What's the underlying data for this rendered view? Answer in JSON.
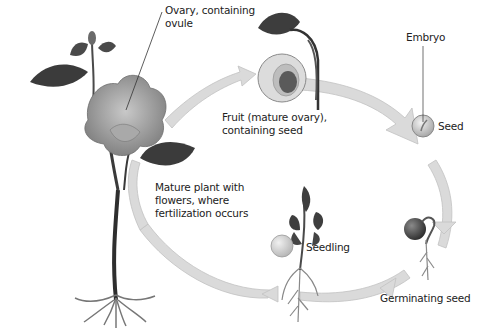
{
  "diagram": {
    "type": "plant-life-cycle",
    "colors": {
      "arrow": "#d9d9d9",
      "arrow_edge": "#bdbdbd",
      "leaf_dark": "#3a3a3a",
      "flower": "#9a9a9a",
      "text": "#222222"
    },
    "stages": [
      {
        "id": "mature-plant",
        "label": "Mature plant with\nflowers, where\nfertilization occurs"
      },
      {
        "id": "ovary",
        "label": "Ovary, containing\novule"
      },
      {
        "id": "fruit",
        "label": "Fruit (mature ovary),\ncontaining seed"
      },
      {
        "id": "embryo",
        "label": "Embryo"
      },
      {
        "id": "seed",
        "label": "Seed"
      },
      {
        "id": "germinating-seed",
        "label": "Germinating seed"
      },
      {
        "id": "seedling",
        "label": "Seedling"
      }
    ]
  }
}
